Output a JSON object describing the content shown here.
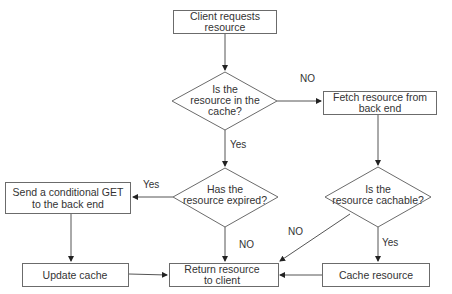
{
  "diagram": {
    "type": "flowchart",
    "colors": {
      "stroke": "#6b6b6b",
      "edge": "#555555",
      "text": "#333333",
      "background": "#ffffff"
    },
    "nodes": {
      "client_requests": {
        "shape": "box",
        "lines": [
          "Client requests",
          "resource"
        ]
      },
      "in_cache": {
        "shape": "diamond",
        "lines": [
          "Is the",
          "resource in the",
          "cache?"
        ]
      },
      "fetch": {
        "shape": "box",
        "lines": [
          "Fetch resource from",
          "back end"
        ]
      },
      "expired": {
        "shape": "diamond",
        "lines": [
          "Has the",
          "resource expired?"
        ]
      },
      "cachable": {
        "shape": "diamond",
        "lines": [
          "Is the",
          "resource cachable?"
        ]
      },
      "conditional_get": {
        "shape": "box",
        "lines": [
          "Send a conditional GET",
          "to the back end"
        ]
      },
      "update_cache": {
        "shape": "box",
        "lines": [
          "Update cache"
        ]
      },
      "return_resource": {
        "shape": "box",
        "lines": [
          "Return resource",
          "to client"
        ]
      },
      "cache_resource": {
        "shape": "box",
        "lines": [
          "Cache resource"
        ]
      }
    },
    "edges": [
      {
        "from": "client_requests",
        "to": "in_cache",
        "label": ""
      },
      {
        "from": "in_cache",
        "to": "fetch",
        "label": "NO"
      },
      {
        "from": "in_cache",
        "to": "expired",
        "label": "Yes"
      },
      {
        "from": "fetch",
        "to": "cachable",
        "label": ""
      },
      {
        "from": "expired",
        "to": "conditional_get",
        "label": "Yes"
      },
      {
        "from": "expired",
        "to": "return_resource",
        "label": "NO"
      },
      {
        "from": "cachable",
        "to": "return_resource",
        "label": "NO"
      },
      {
        "from": "cachable",
        "to": "cache_resource",
        "label": "Yes"
      },
      {
        "from": "conditional_get",
        "to": "update_cache",
        "label": ""
      },
      {
        "from": "update_cache",
        "to": "return_resource",
        "label": ""
      },
      {
        "from": "cache_resource",
        "to": "return_resource",
        "label": ""
      }
    ]
  }
}
